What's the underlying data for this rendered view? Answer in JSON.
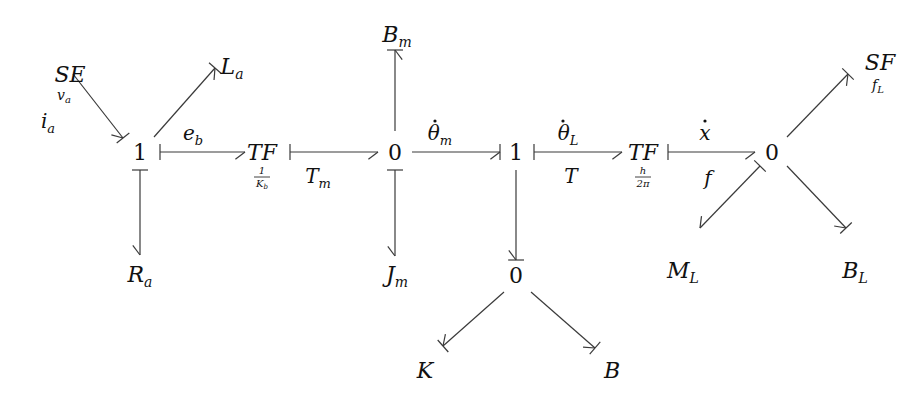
{
  "diagram": {
    "type": "bond-graph",
    "stroke_color": "#3a3a3a",
    "nodes": [
      {
        "id": "SE",
        "kind": "element",
        "main": "SE",
        "sub": "v",
        "subsub": "a",
        "x": 70,
        "y": 82,
        "subx": 64,
        "suby": 100
      },
      {
        "id": "La",
        "kind": "element",
        "main": "L",
        "sub": "a",
        "x": 232,
        "y": 74
      },
      {
        "id": "J1a",
        "kind": "junction",
        "main": "1",
        "x": 140,
        "y": 160
      },
      {
        "id": "Ra",
        "kind": "element",
        "main": "R",
        "sub": "a",
        "x": 140,
        "y": 282
      },
      {
        "id": "TF1",
        "kind": "element",
        "main": "TF",
        "x": 262,
        "y": 160,
        "ratio_num": "1",
        "ratio_den": "K",
        "ratio_den_sub": "b"
      },
      {
        "id": "J0a",
        "kind": "junction",
        "main": "0",
        "x": 395,
        "y": 160
      },
      {
        "id": "Bm",
        "kind": "element",
        "main": "B",
        "sub": "m",
        "x": 397,
        "y": 42
      },
      {
        "id": "Jm",
        "kind": "element",
        "main": "J",
        "sub": "m",
        "x": 397,
        "y": 282
      },
      {
        "id": "J1b",
        "kind": "junction",
        "main": "1",
        "x": 516,
        "y": 160
      },
      {
        "id": "J0b",
        "kind": "junction",
        "main": "0",
        "x": 516,
        "y": 283
      },
      {
        "id": "K",
        "kind": "element",
        "main": "K",
        "x": 425,
        "y": 378
      },
      {
        "id": "B",
        "kind": "element",
        "main": "B",
        "x": 612,
        "y": 378
      },
      {
        "id": "TF2",
        "kind": "element",
        "main": "TF",
        "x": 643,
        "y": 160,
        "ratio_num": "h",
        "ratio_den": "2π"
      },
      {
        "id": "J0c",
        "kind": "junction",
        "main": "0",
        "x": 772,
        "y": 160
      },
      {
        "id": "SF",
        "kind": "element",
        "main": "SF",
        "sub": "f",
        "subsub": "L",
        "x": 880,
        "y": 70,
        "subx": 878,
        "suby": 90
      },
      {
        "id": "ML",
        "kind": "element",
        "main": "M",
        "sub": "L",
        "x": 683,
        "y": 278
      },
      {
        "id": "BL",
        "kind": "element",
        "main": "B",
        "sub": "L",
        "x": 855,
        "y": 278
      }
    ],
    "bonds": [
      {
        "from": "SE",
        "to": "J1a",
        "x1": 73,
        "y1": 74,
        "x2": 123,
        "y2": 138,
        "arrow": "end",
        "stroke": "end"
      },
      {
        "from": "J1a",
        "to": "La",
        "x1": 154,
        "y1": 137,
        "x2": 215,
        "y2": 68,
        "arrow": "end",
        "stroke": "end"
      },
      {
        "from": "J1a",
        "to": "TF1",
        "x1": 160,
        "y1": 152,
        "x2": 245,
        "y2": 152,
        "arrow": "end",
        "stroke": "start"
      },
      {
        "from": "J1a",
        "to": "Ra",
        "x1": 140,
        "y1": 170,
        "x2": 140,
        "y2": 255,
        "arrow": "end",
        "stroke": "start"
      },
      {
        "from": "TF1",
        "to": "J0a",
        "x1": 290,
        "y1": 152,
        "x2": 378,
        "y2": 152,
        "arrow": "end",
        "stroke": "start"
      },
      {
        "from": "J0a",
        "to": "Bm",
        "x1": 395,
        "y1": 131,
        "x2": 395,
        "y2": 50,
        "arrow": "end",
        "stroke": "end"
      },
      {
        "from": "J0a",
        "to": "Jm",
        "x1": 395,
        "y1": 170,
        "x2": 395,
        "y2": 256,
        "arrow": "end",
        "stroke": "start"
      },
      {
        "from": "J0a",
        "to": "J1b",
        "x1": 412,
        "y1": 152,
        "x2": 500,
        "y2": 152,
        "arrow": "end",
        "stroke": "end"
      },
      {
        "from": "J1b",
        "to": "TF2",
        "x1": 534,
        "y1": 152,
        "x2": 622,
        "y2": 152,
        "arrow": "end",
        "stroke": "start"
      },
      {
        "from": "J1b",
        "to": "J0b",
        "x1": 516,
        "y1": 170,
        "x2": 516,
        "y2": 260,
        "arrow": "end",
        "stroke": "end"
      },
      {
        "from": "J0b",
        "to": "K",
        "x1": 504,
        "y1": 292,
        "x2": 443,
        "y2": 346,
        "arrow": "end",
        "stroke": "end"
      },
      {
        "from": "J0b",
        "to": "B",
        "x1": 531,
        "y1": 292,
        "x2": 595,
        "y2": 348,
        "arrow": "end",
        "stroke": "end"
      },
      {
        "from": "TF2",
        "to": "J0c",
        "x1": 668,
        "y1": 152,
        "x2": 755,
        "y2": 152,
        "arrow": "end",
        "stroke": "start"
      },
      {
        "from": "J0c",
        "to": "SF",
        "x1": 787,
        "y1": 137,
        "x2": 848,
        "y2": 74,
        "arrow": "end",
        "stroke": "end"
      },
      {
        "from": "J0c",
        "to": "ML",
        "x1": 760,
        "y1": 166,
        "x2": 700,
        "y2": 228,
        "arrow": "end",
        "stroke": "start"
      },
      {
        "from": "J0c",
        "to": "BL",
        "x1": 787,
        "y1": 166,
        "x2": 846,
        "y2": 228,
        "arrow": "end",
        "stroke": "end"
      }
    ],
    "labels": [
      {
        "id": "ia",
        "main": "i",
        "sub": "a",
        "x": 48,
        "y": 128
      },
      {
        "id": "eb",
        "main": "e",
        "sub": "b",
        "x": 193,
        "y": 140
      },
      {
        "id": "Tm",
        "main": "T",
        "sub": "m",
        "x": 318,
        "y": 183
      },
      {
        "id": "theta_m",
        "main": "θ",
        "sub": "m",
        "dot": true,
        "x": 440,
        "y": 140
      },
      {
        "id": "theta_L",
        "main": "θ",
        "sub": "L",
        "dot": true,
        "x": 568,
        "y": 140
      },
      {
        "id": "T",
        "main": "T",
        "x": 571,
        "y": 183
      },
      {
        "id": "xdot",
        "main": "x",
        "dot": true,
        "x": 705,
        "y": 140
      },
      {
        "id": "f",
        "main": "f",
        "x": 708,
        "y": 185
      }
    ]
  }
}
